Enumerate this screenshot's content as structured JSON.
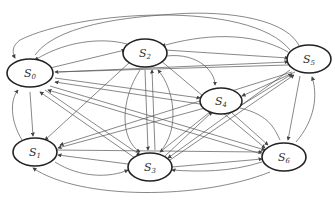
{
  "diagram": {
    "type": "state-transition-graph",
    "nodes": [
      {
        "id": "S0",
        "label": "S",
        "sub": "0",
        "cx": 30,
        "cy": 73
      },
      {
        "id": "S2",
        "label": "S",
        "sub": "2",
        "cx": 145,
        "cy": 53
      },
      {
        "id": "S5",
        "label": "S",
        "sub": "5",
        "cx": 309,
        "cy": 59
      },
      {
        "id": "S4",
        "label": "S",
        "sub": "4",
        "cx": 221,
        "cy": 101
      },
      {
        "id": "S1",
        "label": "S",
        "sub": "1",
        "cx": 35,
        "cy": 152
      },
      {
        "id": "S3",
        "label": "S",
        "sub": "3",
        "cx": 150,
        "cy": 167
      },
      {
        "id": "S6",
        "label": "S",
        "sub": "6",
        "cx": 284,
        "cy": 157
      }
    ],
    "edge_color": "#555555",
    "node_stroke": "#222222"
  }
}
